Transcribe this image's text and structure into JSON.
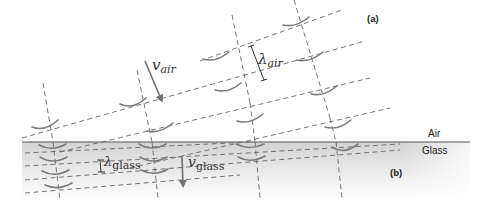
{
  "figure": {
    "panel_a_label": "(a)",
    "panel_b_label": "(b)",
    "media": {
      "upper": "Air",
      "lower": "Glass"
    },
    "symbols": {
      "v_air": {
        "base": "v",
        "sub": "air"
      },
      "lambda_air": {
        "base": "λ",
        "sub": "air"
      },
      "lambda_glass": {
        "base": "λ",
        "sub": "glass"
      },
      "v_glass": {
        "base": "v",
        "sub": "glass"
      }
    },
    "colors": {
      "wavefront": "#666666",
      "arc": "#7a7a7a",
      "boundary": "#555555",
      "glass_top": "#d4d4d4",
      "glass_bottom": "#ffffff",
      "arrow": "#707070"
    }
  }
}
